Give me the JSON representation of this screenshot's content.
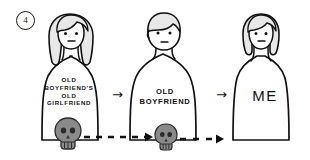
{
  "panel": {
    "number": "4",
    "number_icon": "circled-number-icon"
  },
  "figures": [
    {
      "id": "figure-1",
      "character": "long-haired-woman",
      "label": "OLD\nBOYFRIEND'S\nOLD\nGIRLFRIEND"
    },
    {
      "id": "figure-2",
      "character": "short-haired-man",
      "label": "OLD\nBOYFRIEND"
    },
    {
      "id": "figure-3",
      "character": "tucked-hair-woman",
      "label": "ME"
    }
  ],
  "arrows": [
    {
      "id": "arrow-1",
      "glyph": "→",
      "kind": "solid-right-arrow"
    },
    {
      "id": "arrow-2",
      "glyph": "→",
      "kind": "solid-right-arrow"
    }
  ],
  "skulls": [
    {
      "id": "skull-1",
      "icon": "skull-icon"
    },
    {
      "id": "skull-2",
      "icon": "skull-icon"
    }
  ],
  "dashed_arrows": [
    {
      "id": "dashed-arrow-1",
      "icon": "dashed-right-arrow-icon"
    },
    {
      "id": "dashed-arrow-2",
      "icon": "dashed-right-arrow-icon"
    }
  ],
  "colors": {
    "ink": "#111111",
    "hair_fill": "#e8e8e8",
    "skull_fill": "#8a8a8a",
    "skull_detail": "#2b2b2b",
    "paper": "#ffffff"
  }
}
